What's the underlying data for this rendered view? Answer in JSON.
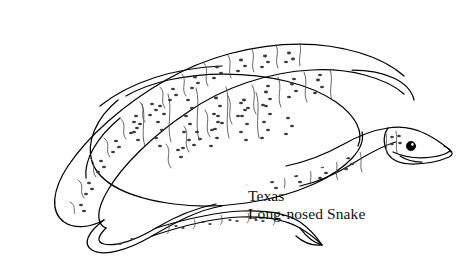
{
  "illustration": {
    "subject": "snake",
    "style": "black-and-white line drawing",
    "common_name": "Texas Long-nosed Snake",
    "pose": "coiled with head at right and tail at lower left",
    "stroke_color": "#000000",
    "background_color": "#ffffff",
    "eye_color": "#000000",
    "detail_stroke_color": "#555555",
    "speckle_color": "#444444"
  },
  "caption": {
    "line1": "Texas",
    "line2": "Long-nosed Snake"
  },
  "canvas": {
    "width": 460,
    "height": 269
  }
}
